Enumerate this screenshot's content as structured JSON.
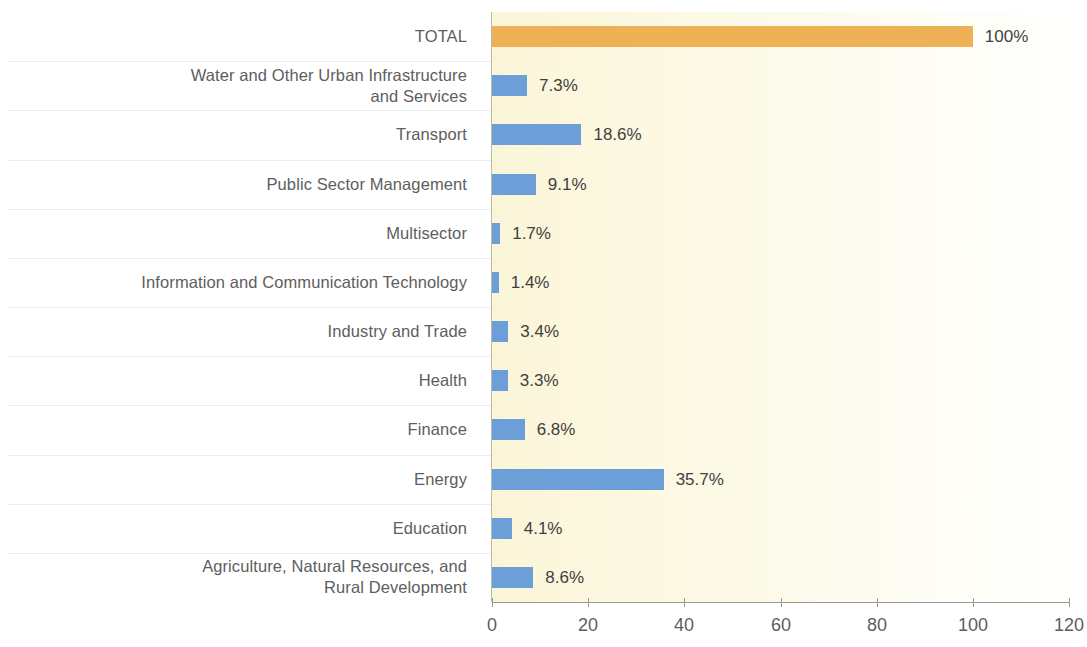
{
  "chart_data": {
    "type": "bar",
    "orientation": "horizontal",
    "title": "",
    "subtitle": "",
    "xlabel": "",
    "ylabel": "",
    "xlim": [
      0,
      120
    ],
    "xticks": [
      0,
      20,
      40,
      60,
      80,
      100,
      120
    ],
    "xtick_labels": [
      "0",
      "20",
      "40",
      "60",
      "80",
      "100",
      "120"
    ],
    "grid": true,
    "grid_axis": "y",
    "legend": false,
    "value_unit": "%",
    "categories": [
      "TOTAL",
      "Water and Other Urban Infrastructure\nand Services",
      "Transport",
      "Public Sector Management",
      "Multisector",
      "Information and Communication Technology",
      "Industry and Trade",
      "Health",
      "Finance",
      "Energy",
      "Education",
      "Agriculture, Natural Resources, and\nRural Development"
    ],
    "values": [
      100,
      7.3,
      18.6,
      9.1,
      1.7,
      1.4,
      3.4,
      3.3,
      6.8,
      35.7,
      4.1,
      8.6
    ],
    "value_labels": [
      "100%",
      "7.3%",
      "18.6%",
      "9.1%",
      "1.7%",
      "1.4%",
      "3.4%",
      "3.3%",
      "6.8%",
      "35.7%",
      "4.1%",
      "8.6%"
    ],
    "bar_colors": [
      "#efb155",
      "#6c9fd8",
      "#6c9fd8",
      "#6c9fd8",
      "#6c9fd8",
      "#6c9fd8",
      "#6c9fd8",
      "#6c9fd8",
      "#6c9fd8",
      "#6c9fd8",
      "#6c9fd8",
      "#6c9fd8"
    ]
  },
  "colors": {
    "total_bar": "#efb155",
    "sector_bar": "#6c9fd8",
    "plot_background": "#fbf5d8",
    "gridline": "#e3f2f0",
    "axis": "#9a9a92",
    "label_text": "#5e5e5e",
    "value_text": "#3f3f3f"
  }
}
